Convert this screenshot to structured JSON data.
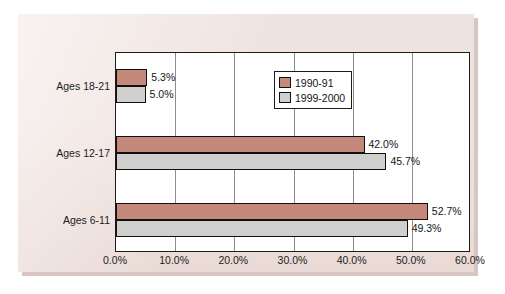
{
  "chart_data": {
    "type": "bar",
    "orientation": "horizontal",
    "title": "",
    "subtitle": "",
    "xlabel": "",
    "ylabel": "",
    "xlim": [
      0,
      60
    ],
    "xticks": [
      "0.0%",
      "10.0%",
      "20.0%",
      "30.0%",
      "40.0%",
      "50.0%",
      "60.0%"
    ],
    "xtick_values": [
      0,
      10,
      20,
      30,
      40,
      50,
      60
    ],
    "grid": "vertical",
    "legend_position": "inside-top-right",
    "categories": [
      "Ages 18-21",
      "Ages 12-17",
      "Ages 6-11"
    ],
    "series": [
      {
        "name": "1990-91",
        "color": "#c4897a",
        "values": [
          5.3,
          42.0,
          52.7
        ],
        "labels": [
          "5.3%",
          "42.0%",
          "52.7%"
        ]
      },
      {
        "name": "1999-2000",
        "color": "#cfcfcd",
        "values": [
          5.0,
          45.7,
          49.3
        ],
        "labels": [
          "5.0%",
          "45.7%",
          "49.3%"
        ]
      }
    ]
  },
  "colors": {
    "series_1990_91": "#c4897a",
    "series_1999_2000": "#cfcfcd",
    "panel_background": "#f0e4e0",
    "plot_background": "#ffffff",
    "axis_line": "#1b1b1b",
    "gridline": "#8e8e8e",
    "text": "#141414"
  }
}
